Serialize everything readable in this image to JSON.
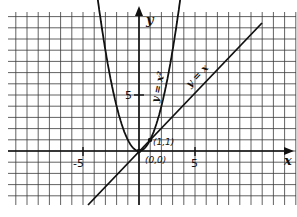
{
  "figure": {
    "x_axis_label": "x",
    "y_axis_label": "y",
    "tick_labels": {
      "x_neg": "-5",
      "x_pos": "5",
      "y_pos": "5"
    },
    "curves": [
      {
        "name": "parabola",
        "label": "y = x²"
      },
      {
        "name": "line",
        "label": "y = x"
      }
    ],
    "points": [
      {
        "label": "(0,0)",
        "x": 0,
        "y": 0
      },
      {
        "label": "(1,1)",
        "x": 1,
        "y": 1
      }
    ],
    "colors": {
      "ink": "#111111",
      "grid": "#333333",
      "background": "#ffffff"
    }
  }
}
